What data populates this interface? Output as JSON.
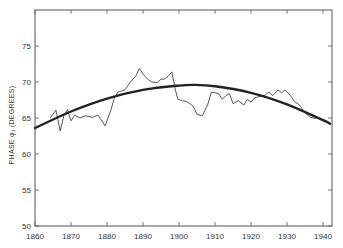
{
  "chart_data": {
    "type": "line",
    "title": "",
    "xlabel": "",
    "ylabel": "PHASE φ₁ (DEGREES)",
    "xlim": [
      1860,
      1942.5
    ],
    "ylim": [
      50,
      80
    ],
    "x_ticks": [
      1860,
      1870,
      1880,
      1890,
      1900,
      1910,
      1920,
      1930,
      1940
    ],
    "y_ticks": [
      50,
      55,
      60,
      65,
      70,
      75
    ],
    "grid": false,
    "legend": null,
    "series": [
      {
        "name": "observed phase",
        "style": "thin",
        "x": [
          1864.2,
          1865.8,
          1867,
          1868,
          1869,
          1870,
          1871,
          1872.5,
          1874,
          1876,
          1877.5,
          1879.5,
          1881,
          1882,
          1883,
          1885,
          1886.5,
          1888,
          1889,
          1890,
          1891.5,
          1892.5,
          1894,
          1895,
          1896,
          1897,
          1898,
          1899,
          1899.7,
          1901,
          1902,
          1903,
          1904,
          1905,
          1906.5,
          1908,
          1909,
          1911,
          1912,
          1913,
          1914,
          1915,
          1916.5,
          1918,
          1919,
          1920,
          1921,
          1922.5,
          1924,
          1925,
          1926,
          1927.5,
          1928.5,
          1929.5,
          1931,
          1932,
          1933.5,
          1935,
          1936.5,
          1938
        ],
        "y": [
          65.0,
          66.1,
          63.2,
          65.3,
          66.2,
          64.6,
          65.4,
          65.0,
          65.3,
          65.1,
          65.4,
          63.9,
          66.0,
          67.7,
          68.6,
          68.9,
          70.0,
          70.8,
          71.9,
          71.1,
          70.3,
          70.0,
          69.9,
          70.4,
          70.4,
          70.8,
          71.4,
          68.9,
          67.6,
          67.4,
          67.3,
          67.0,
          66.6,
          65.5,
          65.3,
          66.9,
          68.6,
          68.4,
          67.6,
          68.1,
          68.4,
          67.0,
          67.4,
          66.8,
          67.6,
          67.2,
          67.8,
          68.0,
          68.2,
          68.6,
          68.1,
          68.9,
          68.5,
          68.9,
          68.1,
          67.3,
          66.8,
          65.7,
          65.1,
          64.9
        ]
      },
      {
        "name": "fitted parabola",
        "style": "thick",
        "x": [
          1860,
          1870,
          1880,
          1890,
          1900,
          1904,
          1910,
          1920,
          1930,
          1940,
          1942
        ],
        "y": [
          63.6,
          65.9,
          67.7,
          68.9,
          69.5,
          69.6,
          69.4,
          68.5,
          66.9,
          64.7,
          64.2
        ]
      }
    ]
  },
  "axes": {
    "ylabel": "PHASE φ₁ (DEGREES)",
    "x_tick_labels": [
      "1860",
      "1870",
      "1880",
      "1890",
      "1900",
      "1910",
      "1920",
      "1930",
      "1940"
    ],
    "y_tick_labels": [
      "50",
      "55",
      "60",
      "65",
      "70",
      "75"
    ]
  }
}
